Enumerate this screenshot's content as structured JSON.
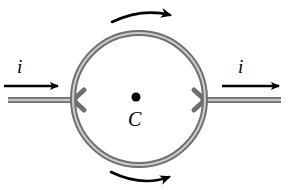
{
  "figure": {
    "background_color": "#ffffff",
    "tube_color_outer": "#6e6e6e",
    "tube_color_inner": "#b4b4b4",
    "arrow_color": "#000000",
    "point_color": "#000000"
  },
  "labels": {
    "current_left": "i",
    "current_right": "i",
    "center_point": "C"
  },
  "loop": {
    "center_x": 139,
    "center_y": 99,
    "radius": 66,
    "tube_width": 5
  },
  "center_marker": {
    "x": 136,
    "y": 97,
    "radius": 4.5
  },
  "leads": {
    "left": {
      "start_x": 8,
      "end_x": 73,
      "y": 100
    },
    "right": {
      "start_x": 205,
      "end_x": 281,
      "y": 100
    }
  },
  "straight_arrows": [
    {
      "name": "current-in",
      "x1": 4,
      "x2": 62,
      "y": 86,
      "direction": "right"
    },
    {
      "name": "current-out",
      "x1": 222,
      "x2": 284,
      "y": 86,
      "direction": "right"
    }
  ],
  "curved_arrows": [
    {
      "name": "circulation-top",
      "start_x": 112,
      "start_y": 22,
      "end_x": 176,
      "end_y": 14,
      "direction": "clockwise"
    },
    {
      "name": "circulation-bottom",
      "start_x": 111,
      "start_y": 172,
      "end_x": 176,
      "end_y": 177,
      "direction": "clockwise"
    }
  ]
}
